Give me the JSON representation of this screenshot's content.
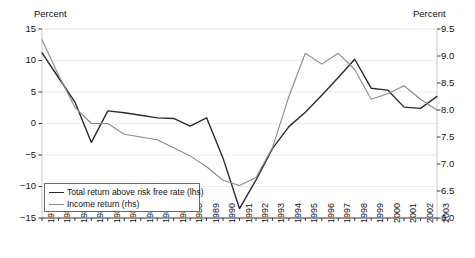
{
  "chart_data": {
    "type": "line",
    "title": "",
    "xlabel": "",
    "grid": true,
    "legend_position": "inside-bottom-left",
    "axis_title_left": "Percent",
    "axis_title_right": "Percent",
    "categories": [
      "1979",
      "1980",
      "1981",
      "1982",
      "1983",
      "1984",
      "1985",
      "1986",
      "1987",
      "1988",
      "1989",
      "1990",
      "1991",
      "1992",
      "1993",
      "1994",
      "1995",
      "1996",
      "1997",
      "1998",
      "1999",
      "2000",
      "2001",
      "2002",
      "2003"
    ],
    "left_axis": {
      "label": "Percent",
      "ticks": [
        "15",
        "10",
        "5",
        "0",
        "-5",
        "-10",
        "-15"
      ],
      "tick_values": [
        15,
        10,
        5,
        0,
        -5,
        -10,
        -15
      ],
      "ylim": [
        -15,
        15
      ]
    },
    "right_axis": {
      "label": "Percent",
      "ticks": [
        "9.5",
        "9.0",
        "8.5",
        "8.0",
        "7.5",
        "7.0",
        "6.5",
        "6.0"
      ],
      "tick_values": [
        9.5,
        9.0,
        8.5,
        8.0,
        7.5,
        7.0,
        6.5,
        6.0
      ],
      "ylim": [
        6.0,
        9.5
      ]
    },
    "series": [
      {
        "name": "Total return above risk free rate (lhs)",
        "axis": "left",
        "color": "#2b2b2b",
        "values": [
          11.2,
          7.3,
          3.4,
          -3.0,
          2.0,
          1.7,
          1.3,
          0.9,
          0.8,
          -0.4,
          0.9,
          -5.5,
          -13.5,
          -9.0,
          -4.0,
          -0.5,
          1.8,
          4.5,
          7.3,
          10.2,
          5.6,
          5.3,
          2.6,
          2.4,
          4.3
        ]
      },
      {
        "name": "Income return (rhs)",
        "axis": "right",
        "color": "#8a8a8a",
        "values": [
          9.3,
          8.65,
          8.05,
          7.75,
          7.75,
          7.55,
          7.5,
          7.45,
          7.3,
          7.15,
          6.95,
          6.7,
          6.6,
          6.75,
          7.3,
          8.25,
          9.05,
          8.85,
          9.05,
          8.75,
          8.2,
          8.3,
          8.45,
          8.2,
          8.0
        ]
      }
    ],
    "legend": [
      {
        "label": "Total return above risk free rate (lhs)",
        "color": "#2b2b2b"
      },
      {
        "label": "Income return (rhs)",
        "color": "#8a8a8a"
      }
    ]
  }
}
